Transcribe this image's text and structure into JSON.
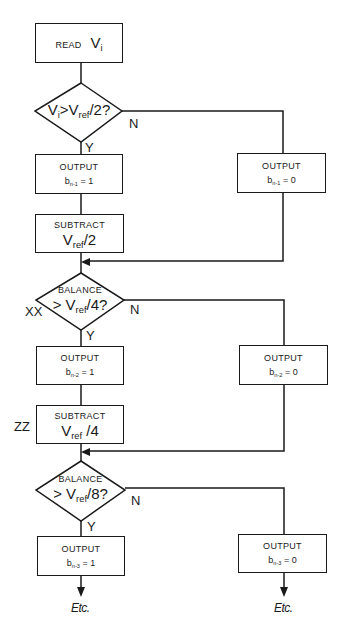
{
  "flowchart": {
    "read": {
      "label": "READ",
      "var": "V",
      "sub": "i"
    },
    "decision1": {
      "lhs": "V",
      "lhs_sub": "i",
      "op": ">",
      "rhs": "V",
      "rhs_sub": "ref",
      "tail": "/2?"
    },
    "decision2": {
      "top": "BALANCE",
      "op": ">",
      "rhs": "V",
      "rhs_sub": "ref",
      "tail": "/4?"
    },
    "decision3": {
      "top": "BALANCE",
      "op": ">",
      "rhs": "V",
      "rhs_sub": "ref",
      "tail": "/8?"
    },
    "yes_label": "Y",
    "no_label": "N",
    "output_label": "OUTPUT",
    "outputs": [
      {
        "b": "b",
        "sub": "n-1",
        "eq1": " = 1",
        "eq0": " = 0"
      },
      {
        "b": "b",
        "sub": "n-2",
        "eq1": " = 1",
        "eq0": " = 0"
      },
      {
        "b": "b",
        "sub": "n-3",
        "eq1": " = 1",
        "eq0": " = 0"
      }
    ],
    "subtract1": {
      "label": "SUBTRACT",
      "var": "V",
      "sub": "ref",
      "tail": "/2"
    },
    "subtract2": {
      "label": "SUBTRACT",
      "var": "V",
      "sub": "ref",
      "tail": " /4"
    },
    "marker_xx": "XX",
    "marker_zz": "ZZ",
    "etc": "Etc."
  },
  "colors": {
    "line": "#1a1a1a",
    "background": "#ffffff"
  }
}
